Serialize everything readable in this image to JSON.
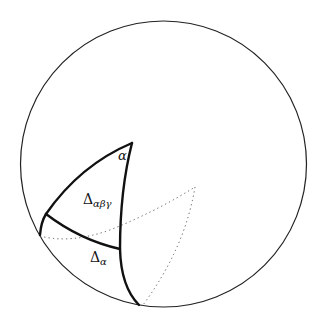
{
  "diagram": {
    "title": "",
    "colors": {
      "background": "#ffffff",
      "stroke": "#111111",
      "boundary": "#222222",
      "dotted": "#555555"
    },
    "boundary_circle": {
      "cx": 163.5,
      "cy": 164,
      "r": 143
    },
    "labels": {
      "alpha": "α",
      "delta_abg_main": "Δ",
      "delta_abg_sub": "αβγ",
      "delta_a_main": "Δ",
      "delta_a_sub": "α"
    },
    "regions": [
      {
        "id": "delta-alpha-beta-gamma",
        "label": "Δαβγ"
      },
      {
        "id": "delta-alpha",
        "label": "Δα"
      }
    ],
    "vertices": {
      "top": [
        132,
        143
      ],
      "left": [
        46,
        214
      ],
      "left_boundary": [
        40,
        235
      ],
      "inner_right": [
        120,
        249
      ],
      "bottom_boundary": [
        139,
        305
      ],
      "dotted_apex": [
        195,
        187
      ],
      "dotted_bottom": [
        143,
        305
      ]
    }
  }
}
